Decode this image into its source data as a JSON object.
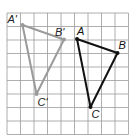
{
  "diagram": {
    "type": "grid-translation",
    "grid": {
      "origin_x": 7,
      "origin_y": 13,
      "cell_size": 13.5,
      "columns": 9,
      "rows": 9,
      "line_color": "#9a9a9a"
    },
    "preimage": {
      "name": "triangle ABC",
      "color": "#111111",
      "vertices": [
        {
          "label": "A",
          "x": 77,
          "y": 39,
          "label_dx": 0,
          "label_dy": -4
        },
        {
          "label": "B",
          "x": 117.5,
          "y": 53,
          "label_dx": 1,
          "label_dy": -4
        },
        {
          "label": "C",
          "x": 90.5,
          "y": 107,
          "label_dx": 1,
          "label_dy": 11
        }
      ]
    },
    "image": {
      "name": "triangle A'B'C'",
      "color": "#9a9a9a",
      "vertices": [
        {
          "label": "A'",
          "x": 22.5,
          "y": 25,
          "label_dx": -15,
          "label_dy": -2
        },
        {
          "label": "B'",
          "x": 64,
          "y": 39.5,
          "label_dx": -9,
          "label_dy": -4
        },
        {
          "label": "C'",
          "x": 36.5,
          "y": 94,
          "label_dx": 1,
          "label_dy": 12
        }
      ]
    }
  }
}
